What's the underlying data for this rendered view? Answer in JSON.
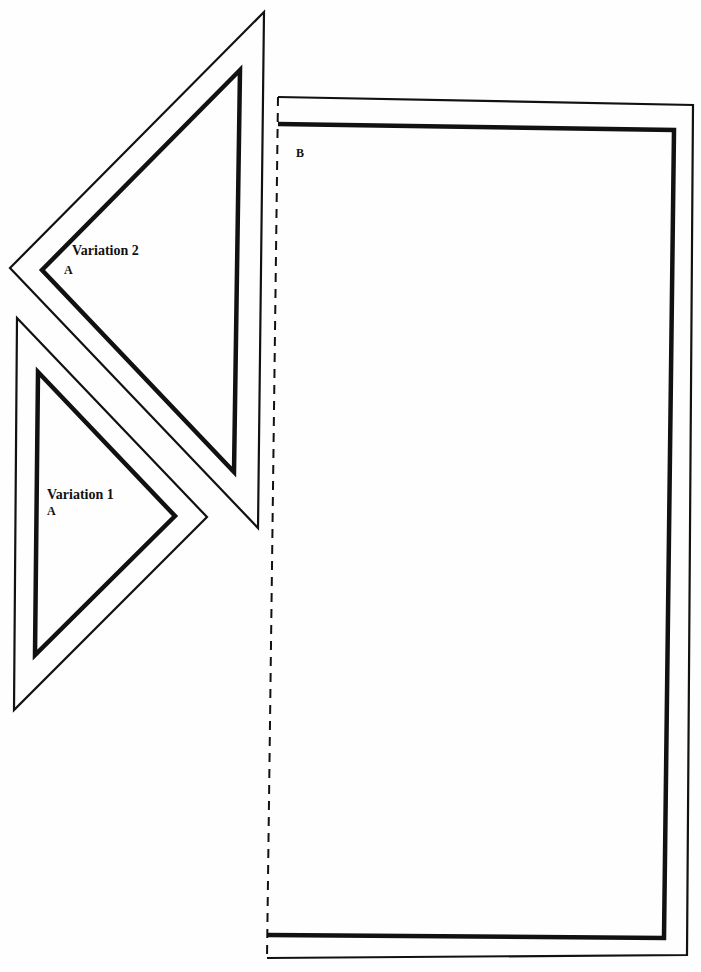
{
  "diagram": {
    "type": "pattern-template",
    "colors": {
      "background": "#ffffff",
      "line": "#111111"
    },
    "pieces": [
      {
        "id": "variation-2",
        "title": "Variation 2",
        "letter": "A",
        "shape": "right-triangle",
        "outer_cut_line": [
          [
            264,
            12
          ],
          [
            10,
            268
          ],
          [
            258,
            528
          ]
        ],
        "inner_seam_line": [
          [
            240,
            70
          ],
          [
            42,
            270
          ],
          [
            234,
            472
          ]
        ]
      },
      {
        "id": "variation-1",
        "title": "Variation 1",
        "letter": "A",
        "shape": "right-triangle",
        "outer_cut_line": [
          [
            17,
            318
          ],
          [
            207,
            517
          ],
          [
            14,
            710
          ]
        ],
        "inner_seam_line": [
          [
            38,
            372
          ],
          [
            175,
            516
          ],
          [
            35,
            655
          ]
        ]
      },
      {
        "id": "piece-b",
        "letter": "B",
        "shape": "rectangle",
        "outer_cut_line": [
          [
            278,
            97
          ],
          [
            693,
            105
          ],
          [
            687,
            955
          ],
          [
            267,
            958
          ]
        ],
        "inner_seam_line": [
          [
            278,
            124
          ],
          [
            674,
            130
          ],
          [
            664,
            938
          ],
          [
            268,
            935
          ]
        ],
        "fold_line": "dashed left edge"
      }
    ]
  },
  "labels": {
    "variation_2_title": "Variation 2",
    "variation_2_letter": "A",
    "variation_1_title": "Variation 1",
    "variation_1_letter": "A",
    "piece_b_letter": "B"
  }
}
